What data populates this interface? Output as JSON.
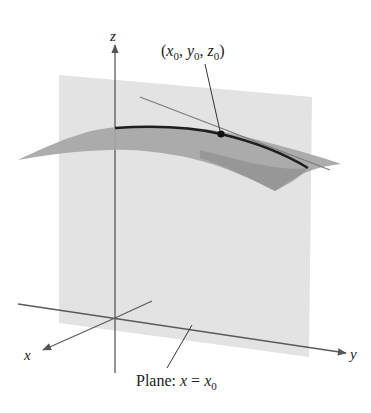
{
  "figure": {
    "axes": {
      "x_label": "x",
      "y_label": "y",
      "z_label": "z"
    },
    "point_label": {
      "open": "(",
      "x": "x",
      "y": "y",
      "z": "z",
      "sub": "0",
      "sep": ", ",
      "close": ")"
    },
    "plane_label": {
      "prefix": "Plane: ",
      "var": "x",
      "eq": " = ",
      "rhs": "x",
      "sub": "0"
    },
    "colors": {
      "plane": "#e3e3e3",
      "surface": "#a3a3a3",
      "surface_dark": "#8f8f8f",
      "curve": "#1e1e1e",
      "axis": "#555555",
      "tangent": "#7a7a7a",
      "text": "#222222"
    }
  }
}
